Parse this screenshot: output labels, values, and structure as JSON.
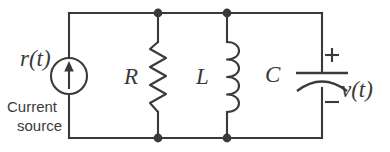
{
  "figure": {
    "type": "electrical-circuit-schematic",
    "stroke_color": "#3a3a3c",
    "background_color": "#ffffff"
  },
  "labels": {
    "source_signal": "r(t)",
    "source_caption_line1": "Current",
    "source_caption_line2": "source",
    "resistor": "R",
    "inductor": "L",
    "capacitor": "C",
    "output_voltage": "v(t)",
    "polarity_plus": "+",
    "polarity_minus": "−"
  },
  "components": [
    {
      "id": "current-source",
      "symbol": "circle-with-up-arrow",
      "label": "r(t)",
      "caption": "Current source",
      "orientation": "vertical",
      "direction": "up"
    },
    {
      "id": "resistor",
      "symbol": "zigzag",
      "label": "R",
      "orientation": "vertical",
      "zigzag_turns": 6
    },
    {
      "id": "inductor",
      "symbol": "coil",
      "label": "L",
      "orientation": "vertical",
      "coil_loops": 4
    },
    {
      "id": "capacitor",
      "symbol": "curved-plate-capacitor",
      "label": "C",
      "orientation": "vertical",
      "polarity_top": "+",
      "polarity_bottom": "−",
      "measured_voltage": "v(t)"
    }
  ],
  "nodes": [
    {
      "id": "top-node-left",
      "x": 158,
      "y": 13
    },
    {
      "id": "top-node-right",
      "x": 227,
      "y": 13
    },
    {
      "id": "bottom-node-left",
      "x": 158,
      "y": 138
    },
    {
      "id": "bottom-node-right",
      "x": 227,
      "y": 138
    }
  ]
}
